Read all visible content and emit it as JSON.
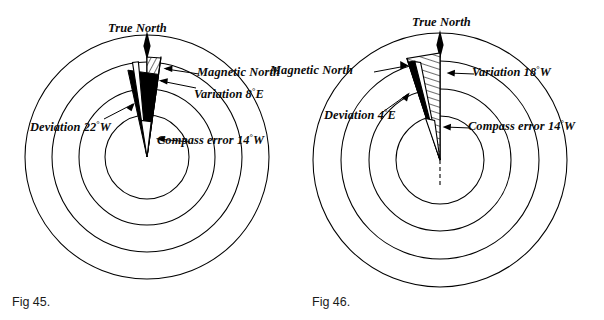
{
  "page": {
    "background": "#ffffff",
    "ink": "#000000",
    "width": 604,
    "height": 320
  },
  "figures": [
    {
      "id": "fig-45",
      "caption": "Fig 45.",
      "center": {
        "x": 147,
        "y": 157
      },
      "rings": [
        42,
        68,
        95,
        122
      ],
      "true_north_label": "True North",
      "magnetic_north_deg": 8,
      "compass_north_deg": -14,
      "labels": {
        "magnetic_north": "Magnetic North",
        "variation": "Variation 8",
        "variation_suffix": "E",
        "deviation": "Deviation 22",
        "deviation_suffix": "W",
        "compass_error": "Compass error 14",
        "compass_error_suffix": "W"
      },
      "values": {
        "variation_deg": 8,
        "variation_dir": "E",
        "deviation_deg": 22,
        "deviation_dir": "W",
        "compass_error_deg": 14,
        "compass_error_dir": "W"
      }
    },
    {
      "id": "fig-46",
      "caption": "Fig 46.",
      "center": {
        "x": 138,
        "y": 160
      },
      "rings": [
        44,
        71,
        99,
        127
      ],
      "true_north_label": "True North",
      "magnetic_north_deg": -18,
      "compass_north_deg": -14,
      "labels": {
        "magnetic_north": "Magnetic North",
        "variation": "Variation 18",
        "variation_suffix": "W",
        "deviation": "Deviation 4",
        "deviation_suffix": "E",
        "compass_error": "Compass error 14",
        "compass_error_suffix": "W"
      },
      "values": {
        "variation_deg": 18,
        "variation_dir": "W",
        "deviation_deg": 4,
        "deviation_dir": "E",
        "compass_error_deg": 14,
        "compass_error_dir": "W"
      }
    }
  ]
}
